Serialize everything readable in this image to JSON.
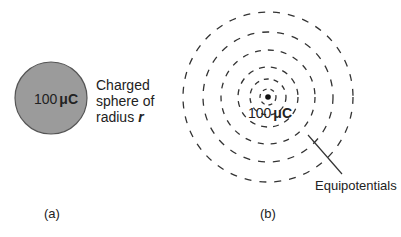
{
  "panel_a": {
    "caption": "(a)",
    "sphere_label_value": "100",
    "sphere_label_unit": "μC",
    "description_lines": [
      "Charged",
      "sphere of",
      "radius"
    ],
    "radius_symbol": "r",
    "sphere_fill": "#9b9b9b",
    "sphere_stroke": "#555555"
  },
  "panel_b": {
    "caption": "(b)",
    "charge_label_value": "100",
    "charge_label_unit": "μC",
    "equipotential_label": "Equipotentials",
    "ring_radii": [
      8,
      18,
      30,
      47,
      65,
      85
    ],
    "line_color": "#333333"
  }
}
